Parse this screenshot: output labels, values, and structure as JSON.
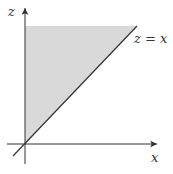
{
  "diagram": {
    "type": "region-plot",
    "axes": {
      "horizontal_label": "x",
      "vertical_label": "z"
    },
    "line_label": "z = x",
    "region": "shaded triangle above line z = x, between z-axis and line",
    "colors": {
      "shade": "#d9d9d9",
      "axis": "#333333",
      "line": "#333333",
      "background": "#ffffff"
    }
  }
}
